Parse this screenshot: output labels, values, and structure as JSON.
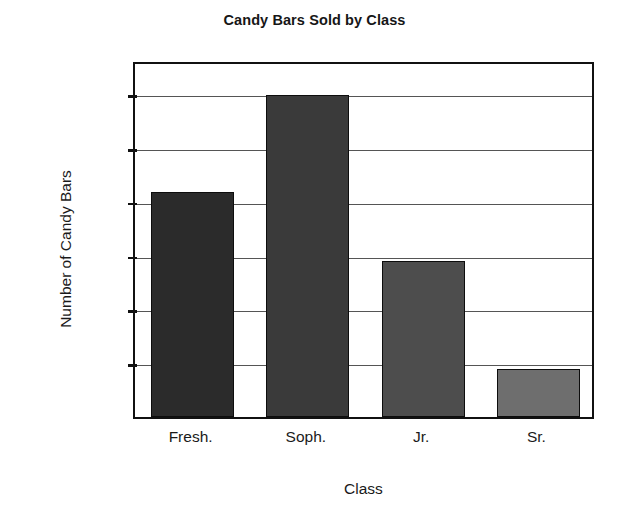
{
  "chart_data": {
    "type": "bar",
    "title": "Candy Bars Sold by Class",
    "xlabel": "Class",
    "ylabel": "Number of Candy Bars",
    "categories": [
      "Fresh.",
      "Soph.",
      "Jr.",
      "Sr."
    ],
    "values": [
      2320,
      2500,
      2190,
      1990
    ],
    "value_labels": [
      "2,320",
      "2,500",
      "2,190",
      "1,990"
    ],
    "ytick_values": [
      2000,
      2100,
      2200,
      2300,
      2400,
      2500
    ],
    "ytick_labels": [
      "2,000",
      "2,100",
      "2,200",
      "2,300",
      "2,400",
      "2,500"
    ],
    "ylim": [
      1896,
      2560
    ],
    "xlim": [
      0,
      4
    ],
    "grid": true,
    "legend": "none",
    "bar_colors": [
      "#2b2b2b",
      "#3a3a3a",
      "#4d4d4d",
      "#6e6e6e"
    ],
    "frame_color": "#111111",
    "gridline_color": "#555555",
    "background": "#ffffff"
  }
}
